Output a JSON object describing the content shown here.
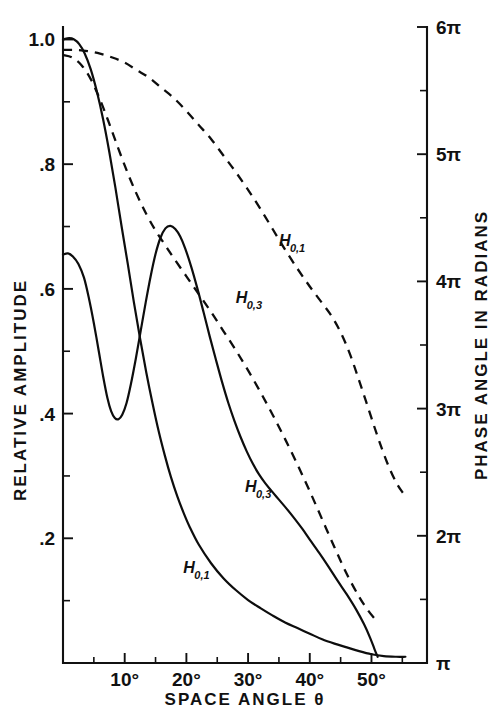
{
  "chart_data": {
    "type": "line",
    "title": "",
    "xlabel": "SPACE ANGLE θ",
    "ylabel": "RELATIVE AMPLITUDE",
    "y2label": "PHASE ANGLE IN RADIANS",
    "xlim": [
      0,
      59
    ],
    "ylim": [
      0,
      1.02
    ],
    "y2lim": [
      3.14159,
      18.8495
    ],
    "grid": false,
    "legend_position": "inline-labels",
    "x_ticks": [
      {
        "value": 10,
        "label": "10°"
      },
      {
        "value": 20,
        "label": "20°"
      },
      {
        "value": 30,
        "label": "30°"
      },
      {
        "value": 40,
        "label": "40°"
      },
      {
        "value": 50,
        "label": "50°"
      }
    ],
    "x_minor_ticks": [
      5,
      15,
      25,
      35,
      45,
      55
    ],
    "y_ticks": [
      {
        "value": 1.0,
        "label": "1.0"
      },
      {
        "value": 0.8,
        "label": ".8"
      },
      {
        "value": 0.6,
        "label": ".6"
      },
      {
        "value": 0.4,
        "label": ".4"
      },
      {
        "value": 0.2,
        "label": ".2"
      }
    ],
    "y_minor_ticks": [
      0.9,
      0.7,
      0.5,
      0.3,
      0.1
    ],
    "y2_ticks": [
      {
        "value": 6,
        "label": "6π"
      },
      {
        "value": 5,
        "label": "5π"
      },
      {
        "value": 4,
        "label": "4π"
      },
      {
        "value": 3,
        "label": "3π"
      },
      {
        "value": 2,
        "label": "2π"
      },
      {
        "value": 1,
        "label": "π"
      }
    ],
    "y2_minor_ticks": [
      5.5,
      4.5,
      3.5,
      2.5,
      1.5
    ],
    "series": [
      {
        "name": "H_{0,1} amplitude",
        "label": "H",
        "label_sub": "0,1",
        "style": "solid",
        "axis": "left",
        "label_x": 19.5,
        "label_y": 0.145,
        "points": [
          [
            0.0,
            1.0
          ],
          [
            1.0,
            1.002
          ],
          [
            1.8,
            1.0
          ],
          [
            2.6,
            0.993
          ],
          [
            3.5,
            0.978
          ],
          [
            4.5,
            0.952
          ],
          [
            5.5,
            0.916
          ],
          [
            6.5,
            0.872
          ],
          [
            7.5,
            0.82
          ],
          [
            8.5,
            0.762
          ],
          [
            9.5,
            0.7
          ],
          [
            10.5,
            0.64
          ],
          [
            11.5,
            0.578
          ],
          [
            12.5,
            0.52
          ],
          [
            13.5,
            0.466
          ],
          [
            14.5,
            0.417
          ],
          [
            15.5,
            0.372
          ],
          [
            16.5,
            0.333
          ],
          [
            17.5,
            0.298
          ],
          [
            18.5,
            0.268
          ],
          [
            19.5,
            0.242
          ],
          [
            20.5,
            0.219
          ],
          [
            22.0,
            0.19
          ],
          [
            24.0,
            0.16
          ],
          [
            26.0,
            0.136
          ],
          [
            28.0,
            0.117
          ],
          [
            30.0,
            0.101
          ],
          [
            32.0,
            0.088
          ],
          [
            34.0,
            0.076
          ],
          [
            36.0,
            0.065
          ],
          [
            38.0,
            0.056
          ],
          [
            40.0,
            0.047
          ],
          [
            42.0,
            0.038
          ],
          [
            44.0,
            0.031
          ],
          [
            46.0,
            0.025
          ],
          [
            48.0,
            0.019
          ],
          [
            50.0,
            0.014
          ],
          [
            52.0,
            0.011
          ],
          [
            54.0,
            0.01
          ],
          [
            55.5,
            0.01
          ]
        ]
      },
      {
        "name": "H_{0,3} amplitude",
        "label": "H",
        "label_sub": "0,3",
        "style": "solid",
        "axis": "left",
        "label_x": 29.5,
        "label_y": 0.275,
        "points": [
          [
            0.0,
            0.655
          ],
          [
            0.8,
            0.657
          ],
          [
            1.6,
            0.652
          ],
          [
            2.5,
            0.64
          ],
          [
            3.4,
            0.618
          ],
          [
            4.2,
            0.585
          ],
          [
            5.0,
            0.545
          ],
          [
            5.8,
            0.5
          ],
          [
            6.5,
            0.46
          ],
          [
            7.2,
            0.425
          ],
          [
            7.8,
            0.404
          ],
          [
            8.4,
            0.393
          ],
          [
            9.0,
            0.391
          ],
          [
            9.6,
            0.398
          ],
          [
            10.3,
            0.417
          ],
          [
            11.0,
            0.447
          ],
          [
            11.8,
            0.488
          ],
          [
            12.6,
            0.533
          ],
          [
            13.4,
            0.578
          ],
          [
            14.2,
            0.62
          ],
          [
            15.0,
            0.656
          ],
          [
            15.8,
            0.682
          ],
          [
            16.6,
            0.697
          ],
          [
            17.4,
            0.701
          ],
          [
            18.2,
            0.696
          ],
          [
            19.0,
            0.684
          ],
          [
            19.8,
            0.665
          ],
          [
            20.8,
            0.635
          ],
          [
            21.8,
            0.6
          ],
          [
            22.8,
            0.562
          ],
          [
            23.8,
            0.523
          ],
          [
            24.8,
            0.486
          ],
          [
            25.8,
            0.45
          ],
          [
            26.8,
            0.417
          ],
          [
            27.8,
            0.388
          ],
          [
            28.8,
            0.362
          ],
          [
            29.8,
            0.339
          ],
          [
            30.8,
            0.319
          ],
          [
            31.8,
            0.302
          ],
          [
            32.8,
            0.288
          ],
          [
            33.8,
            0.276
          ],
          [
            35.0,
            0.262
          ],
          [
            36.2,
            0.248
          ],
          [
            37.5,
            0.232
          ],
          [
            38.8,
            0.215
          ],
          [
            40.0,
            0.198
          ],
          [
            41.5,
            0.177
          ],
          [
            43.0,
            0.155
          ],
          [
            44.5,
            0.132
          ],
          [
            46.0,
            0.11
          ],
          [
            47.5,
            0.086
          ],
          [
            48.8,
            0.062
          ],
          [
            49.8,
            0.04
          ],
          [
            50.5,
            0.022
          ],
          [
            51.0,
            0.01
          ]
        ]
      },
      {
        "name": "H_{0,1} phase",
        "label": "H",
        "label_sub": "0,1",
        "style": "dashed",
        "axis": "right",
        "label_x": 35.0,
        "label_y": 4.28,
        "points": [
          [
            0.0,
            5.82
          ],
          [
            2.0,
            5.82
          ],
          [
            4.0,
            5.81
          ],
          [
            6.0,
            5.79
          ],
          [
            8.0,
            5.76
          ],
          [
            10.0,
            5.72
          ],
          [
            12.0,
            5.66
          ],
          [
            14.0,
            5.6
          ],
          [
            16.0,
            5.52
          ],
          [
            18.0,
            5.44
          ],
          [
            20.0,
            5.34
          ],
          [
            22.0,
            5.23
          ],
          [
            24.0,
            5.12
          ],
          [
            26.0,
            4.99
          ],
          [
            28.0,
            4.86
          ],
          [
            30.0,
            4.72
          ],
          [
            32.0,
            4.57
          ],
          [
            34.0,
            4.41
          ],
          [
            36.0,
            4.25
          ],
          [
            38.0,
            4.1
          ],
          [
            40.0,
            3.96
          ],
          [
            42.0,
            3.83
          ],
          [
            43.5,
            3.73
          ],
          [
            45.0,
            3.6
          ],
          [
            46.5,
            3.43
          ],
          [
            48.0,
            3.22
          ],
          [
            49.5,
            3.0
          ],
          [
            51.0,
            2.78
          ],
          [
            52.5,
            2.58
          ],
          [
            54.0,
            2.42
          ],
          [
            55.2,
            2.33
          ]
        ]
      },
      {
        "name": "H_{0,3} phase",
        "label": "H",
        "label_sub": "0,3",
        "style": "dashed",
        "axis": "right",
        "label_x": 28.0,
        "label_y": 3.83,
        "points": [
          [
            0.0,
            5.78
          ],
          [
            1.5,
            5.76
          ],
          [
            3.0,
            5.7
          ],
          [
            4.5,
            5.59
          ],
          [
            6.0,
            5.43
          ],
          [
            7.5,
            5.24
          ],
          [
            9.0,
            5.04
          ],
          [
            10.5,
            4.85
          ],
          [
            12.0,
            4.68
          ],
          [
            13.5,
            4.53
          ],
          [
            15.0,
            4.4
          ],
          [
            16.5,
            4.29
          ],
          [
            18.0,
            4.18
          ],
          [
            20.0,
            4.04
          ],
          [
            22.0,
            3.9
          ],
          [
            24.0,
            3.76
          ],
          [
            26.0,
            3.61
          ],
          [
            28.0,
            3.46
          ],
          [
            30.0,
            3.3
          ],
          [
            32.0,
            3.13
          ],
          [
            34.0,
            2.95
          ],
          [
            36.0,
            2.76
          ],
          [
            38.0,
            2.56
          ],
          [
            40.0,
            2.35
          ],
          [
            42.0,
            2.13
          ],
          [
            44.0,
            1.91
          ],
          [
            46.0,
            1.7
          ],
          [
            48.0,
            1.52
          ],
          [
            49.5,
            1.41
          ],
          [
            50.5,
            1.35
          ]
        ]
      }
    ],
    "right_axis_bottom_label": "π"
  }
}
